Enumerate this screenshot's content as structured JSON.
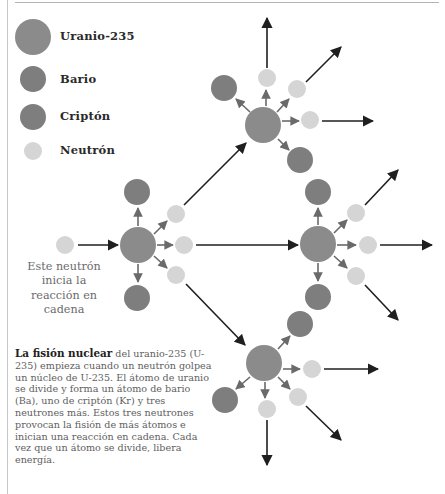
{
  "colors": {
    "uranium": "#8b8b8b",
    "barium": "#7e7e7e",
    "krypton": "#7e7e7e",
    "neutron": "#d5d5d5",
    "short_arrow": "#6a6a6a",
    "long_arrow": "#1f1f1f"
  },
  "legend": {
    "items": [
      {
        "key": "uranium",
        "label": "Uranio-235",
        "shape": "large-circle"
      },
      {
        "key": "barium",
        "label": "Bario",
        "shape": "medium-circle"
      },
      {
        "key": "krypton",
        "label": "Criptón",
        "shape": "medium-circle"
      },
      {
        "key": "neutron",
        "label": "Neutrón",
        "shape": "small-circle"
      }
    ]
  },
  "start_note": "Este neutrón inicia la reacción en cadena",
  "caption": {
    "title": "La fisión nuclear",
    "body": " del uranio-235 (U-235) empieza cuando un neutrón golpea un núcleo de U-235. El átomo de uranio se divide y forma un átomo de bario (Ba), uno de criptón (Kr) y tres neutrones más. Estos tres neutrones provocan la fisión de más átomos e inician una reacción en cadena. Cada vez que un átomo se divide, libera energía."
  },
  "diagram": {
    "clusters": [
      {
        "name": "cluster-left",
        "uranium": [
          138,
          245
        ],
        "barium": [
          137,
          192
        ],
        "krypton": [
          137,
          298
        ],
        "neutrons": [
          [
            176,
            214
          ],
          [
            184,
            245
          ],
          [
            176,
            275
          ]
        ]
      },
      {
        "name": "cluster-top",
        "uranium": [
          263,
          125
        ],
        "barium": [
          224,
          88
        ],
        "krypton": [
          300,
          160
        ],
        "neutrons": [
          [
            267,
            78
          ],
          [
            297,
            89
          ],
          [
            310,
            120
          ]
        ]
      },
      {
        "name": "cluster-right",
        "uranium": [
          318,
          244
        ],
        "barium": [
          318,
          192
        ],
        "krypton": [
          318,
          297
        ],
        "neutrons": [
          [
            356,
            213
          ],
          [
            368,
            245
          ],
          [
            356,
            276
          ]
        ]
      },
      {
        "name": "cluster-bottom",
        "uranium": [
          264,
          363
        ],
        "barium": [
          300,
          324
        ],
        "krypton": [
          225,
          400
        ],
        "neutrons": [
          [
            312,
            369
          ],
          [
            298,
            397
          ],
          [
            267,
            409
          ]
        ]
      }
    ],
    "initial_neutron": [
      65,
      245
    ]
  }
}
